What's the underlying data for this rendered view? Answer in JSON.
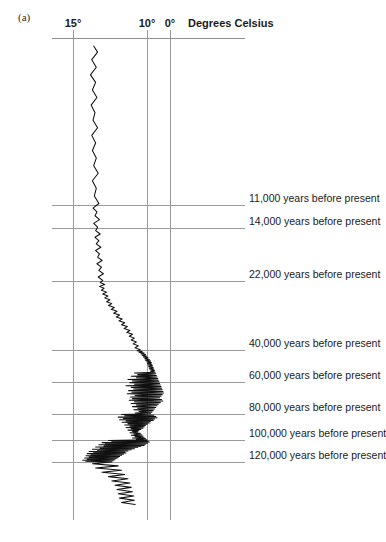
{
  "panel": {
    "label": "(a)"
  },
  "axis": {
    "title": "Degrees Celsius",
    "ticks": [
      {
        "label": "15°",
        "value": 15,
        "x": 73
      },
      {
        "label": "10°",
        "value": 10,
        "x": 147
      },
      {
        "label": "0°",
        "value": 0,
        "x": 170
      }
    ]
  },
  "timeline": [
    {
      "label": "11,000 years before present",
      "years": 11000,
      "y": 205
    },
    {
      "label": "14,000 years before present",
      "years": 14000,
      "y": 228
    },
    {
      "label": "22,000 years before present",
      "years": 22000,
      "y": 281
    },
    {
      "label": "40,000 years before present",
      "years": 40000,
      "y": 350
    },
    {
      "label": "60,000 years before present",
      "years": 60000,
      "y": 382
    },
    {
      "label": "80,000 years before present",
      "years": 80000,
      "y": 414
    },
    {
      "label": "100,000 years before present",
      "years": 100000,
      "y": 440
    },
    {
      "label": "120,000 years before present",
      "years": 120000,
      "y": 462
    }
  ],
  "chart_data": {
    "type": "line",
    "title": "Degrees Celsius",
    "xlabel": "Degrees Celsius",
    "ylabel": "years before present",
    "orientation": "vertical-time-axis",
    "grid": true,
    "legend": "none",
    "xlim": [
      0,
      15
    ],
    "ylim": [
      0,
      130000
    ],
    "x_tick_values": [
      15,
      10,
      0
    ],
    "x_tick_labels": [
      "15°",
      "10°",
      "0°"
    ],
    "y_tick_values": [
      11000,
      14000,
      22000,
      40000,
      60000,
      80000,
      100000,
      120000
    ],
    "y_tick_labels": [
      "11,000 years before present",
      "14,000 years before present",
      "22,000 years before present",
      "40,000 years before present",
      "60,000 years before present",
      "80,000 years before present",
      "100,000 years before present",
      "120,000 years before present"
    ],
    "series": [
      {
        "name": "Reconstructed temperature",
        "color": "#111111",
        "points": [
          [
            11.8,
            500
          ],
          [
            11.2,
            900
          ],
          [
            12.1,
            1400
          ],
          [
            11.4,
            1900
          ],
          [
            12.3,
            2400
          ],
          [
            11.5,
            2900
          ],
          [
            12.0,
            3400
          ],
          [
            11.3,
            3900
          ],
          [
            12.2,
            4400
          ],
          [
            11.6,
            4900
          ],
          [
            11.9,
            5400
          ],
          [
            11.2,
            5900
          ],
          [
            12.1,
            6400
          ],
          [
            11.5,
            6900
          ],
          [
            12.0,
            7400
          ],
          [
            11.4,
            7900
          ],
          [
            11.8,
            8400
          ],
          [
            11.1,
            8900
          ],
          [
            12.0,
            9400
          ],
          [
            11.4,
            9900
          ],
          [
            11.7,
            10400
          ],
          [
            11.0,
            10900
          ],
          [
            11.9,
            11400
          ],
          [
            11.3,
            11900
          ],
          [
            11.6,
            12400
          ],
          [
            10.9,
            12900
          ],
          [
            11.8,
            13400
          ],
          [
            11.2,
            13900
          ],
          [
            11.5,
            14400
          ],
          [
            10.8,
            14900
          ],
          [
            11.6,
            15400
          ],
          [
            11.0,
            15900
          ],
          [
            11.4,
            16400
          ],
          [
            10.7,
            16900
          ],
          [
            11.5,
            17400
          ],
          [
            10.9,
            17900
          ],
          [
            11.2,
            18400
          ],
          [
            10.5,
            18900
          ],
          [
            11.3,
            19400
          ],
          [
            10.6,
            19900
          ],
          [
            11.0,
            20400
          ],
          [
            10.3,
            20900
          ],
          [
            11.1,
            21400
          ],
          [
            10.4,
            21900
          ],
          [
            10.8,
            22400
          ],
          [
            10.1,
            22900
          ],
          [
            10.9,
            23400
          ],
          [
            10.2,
            23900
          ],
          [
            10.6,
            24400
          ],
          [
            9.8,
            24900
          ],
          [
            10.4,
            25400
          ],
          [
            9.6,
            25900
          ],
          [
            10.1,
            26400
          ],
          [
            9.3,
            26900
          ],
          [
            9.8,
            27400
          ],
          [
            9.0,
            27900
          ],
          [
            9.5,
            28400
          ],
          [
            8.6,
            28900
          ],
          [
            9.1,
            29400
          ],
          [
            8.2,
            29900
          ],
          [
            8.7,
            30400
          ],
          [
            7.8,
            30900
          ],
          [
            8.3,
            31400
          ],
          [
            7.4,
            31900
          ],
          [
            7.9,
            32400
          ],
          [
            7.0,
            32900
          ],
          [
            7.5,
            33400
          ],
          [
            6.6,
            33900
          ],
          [
            7.1,
            34400
          ],
          [
            6.2,
            34900
          ],
          [
            6.7,
            35400
          ],
          [
            5.8,
            35900
          ],
          [
            6.3,
            36400
          ],
          [
            5.5,
            36900
          ],
          [
            6.0,
            37400
          ],
          [
            5.2,
            37900
          ],
          [
            5.7,
            38400
          ],
          [
            4.9,
            38900
          ],
          [
            5.4,
            39400
          ],
          [
            4.6,
            39900
          ],
          [
            5.1,
            40400
          ],
          [
            4.3,
            40900
          ],
          [
            4.8,
            41400
          ],
          [
            4.0,
            41900
          ],
          [
            4.5,
            42400
          ],
          [
            3.8,
            42900
          ],
          [
            4.3,
            43400
          ],
          [
            3.6,
            43900
          ],
          [
            4.1,
            44400
          ],
          [
            3.4,
            44900
          ],
          [
            3.9,
            45400
          ],
          [
            3.2,
            45900
          ],
          [
            3.8,
            46400
          ],
          [
            3.0,
            46900
          ],
          [
            3.6,
            47400
          ],
          [
            2.9,
            47900
          ],
          [
            3.5,
            48400
          ],
          [
            2.8,
            48900
          ],
          [
            3.4,
            49400
          ],
          [
            2.7,
            49900
          ],
          [
            3.3,
            50400
          ],
          [
            2.6,
            50900
          ],
          [
            3.2,
            51400
          ],
          [
            2.5,
            51900
          ],
          [
            3.1,
            52400
          ],
          [
            2.4,
            52900
          ],
          [
            3.0,
            53400
          ],
          [
            2.3,
            53900
          ],
          [
            5.5,
            54400
          ],
          [
            2.2,
            54900
          ],
          [
            5.0,
            55400
          ],
          [
            2.1,
            55900
          ],
          [
            6.0,
            56400
          ],
          [
            2.0,
            56900
          ],
          [
            5.2,
            57400
          ],
          [
            1.9,
            57900
          ],
          [
            6.5,
            58400
          ],
          [
            1.8,
            58900
          ],
          [
            5.8,
            59400
          ],
          [
            1.7,
            59900
          ],
          [
            6.2,
            60400
          ],
          [
            1.6,
            60900
          ],
          [
            5.5,
            61400
          ],
          [
            1.5,
            61900
          ],
          [
            6.8,
            62400
          ],
          [
            1.4,
            62900
          ],
          [
            6.0,
            63400
          ],
          [
            1.3,
            63900
          ],
          [
            5.6,
            64400
          ],
          [
            1.2,
            64900
          ],
          [
            6.4,
            65400
          ],
          [
            1.1,
            65900
          ],
          [
            5.9,
            66400
          ],
          [
            1.0,
            66900
          ],
          [
            6.6,
            67400
          ],
          [
            1.2,
            67900
          ],
          [
            5.4,
            68400
          ],
          [
            1.4,
            68900
          ],
          [
            6.1,
            69400
          ],
          [
            1.6,
            69900
          ],
          [
            5.8,
            70400
          ],
          [
            1.3,
            70900
          ],
          [
            6.3,
            71400
          ],
          [
            1.1,
            71900
          ],
          [
            5.5,
            72400
          ],
          [
            1.5,
            72900
          ],
          [
            6.0,
            73400
          ],
          [
            1.8,
            73900
          ],
          [
            5.2,
            74400
          ],
          [
            2.0,
            74900
          ],
          [
            5.8,
            75400
          ],
          [
            2.2,
            75900
          ],
          [
            5.0,
            76400
          ],
          [
            2.4,
            76900
          ],
          [
            5.6,
            77400
          ],
          [
            2.6,
            77900
          ],
          [
            4.8,
            78400
          ],
          [
            2.8,
            78900
          ],
          [
            5.4,
            79400
          ],
          [
            3.0,
            79900
          ],
          [
            7.5,
            80400
          ],
          [
            2.5,
            80900
          ],
          [
            7.0,
            81400
          ],
          [
            2.2,
            81900
          ],
          [
            8.0,
            82400
          ],
          [
            2.0,
            82900
          ],
          [
            7.2,
            83400
          ],
          [
            2.4,
            83900
          ],
          [
            7.8,
            84400
          ],
          [
            2.6,
            84900
          ],
          [
            6.8,
            85400
          ],
          [
            3.0,
            85900
          ],
          [
            7.4,
            86400
          ],
          [
            3.2,
            86900
          ],
          [
            6.5,
            87400
          ],
          [
            3.5,
            87900
          ],
          [
            7.0,
            88400
          ],
          [
            3.8,
            88900
          ],
          [
            6.2,
            89400
          ],
          [
            4.0,
            89900
          ],
          [
            6.8,
            90400
          ],
          [
            4.2,
            90900
          ],
          [
            6.0,
            91400
          ],
          [
            4.5,
            91900
          ],
          [
            6.5,
            92400
          ],
          [
            4.8,
            92900
          ],
          [
            5.8,
            93400
          ],
          [
            5.0,
            93900
          ],
          [
            6.2,
            94400
          ],
          [
            4.6,
            94900
          ],
          [
            5.6,
            95400
          ],
          [
            4.4,
            95900
          ],
          [
            6.0,
            96400
          ],
          [
            4.2,
            96900
          ],
          [
            5.4,
            97400
          ],
          [
            4.0,
            97900
          ],
          [
            5.8,
            98400
          ],
          [
            3.8,
            98900
          ],
          [
            5.2,
            99400
          ],
          [
            3.6,
            99900
          ],
          [
            9.5,
            100400
          ],
          [
            3.4,
            100900
          ],
          [
            9.0,
            101400
          ],
          [
            3.2,
            101900
          ],
          [
            10.5,
            102400
          ],
          [
            3.5,
            102900
          ],
          [
            10.0,
            103400
          ],
          [
            3.8,
            103900
          ],
          [
            11.0,
            104400
          ],
          [
            4.0,
            104900
          ],
          [
            10.2,
            105400
          ],
          [
            4.5,
            105900
          ],
          [
            11.5,
            106400
          ],
          [
            5.0,
            106900
          ],
          [
            10.8,
            107400
          ],
          [
            5.5,
            107900
          ],
          [
            12.0,
            108400
          ],
          [
            6.0,
            108900
          ],
          [
            11.2,
            109400
          ],
          [
            6.5,
            109900
          ],
          [
            12.5,
            110400
          ],
          [
            7.0,
            110900
          ],
          [
            11.8,
            111400
          ],
          [
            6.8,
            111900
          ],
          [
            12.8,
            112400
          ],
          [
            7.2,
            112900
          ],
          [
            12.2,
            113400
          ],
          [
            7.5,
            113900
          ],
          [
            13.0,
            114400
          ],
          [
            7.8,
            114900
          ],
          [
            12.5,
            115400
          ],
          [
            8.0,
            115900
          ],
          [
            13.2,
            116400
          ],
          [
            8.2,
            116900
          ],
          [
            12.8,
            117400
          ],
          [
            8.5,
            117900
          ],
          [
            13.5,
            118400
          ],
          [
            8.8,
            118900
          ],
          [
            13.0,
            119400
          ],
          [
            9.0,
            119900
          ],
          [
            12.0,
            120400
          ],
          [
            8.0,
            120900
          ],
          [
            11.5,
            121400
          ],
          [
            7.5,
            121900
          ],
          [
            10.5,
            122400
          ],
          [
            7.0,
            122900
          ],
          [
            9.5,
            123400
          ],
          [
            6.5,
            123900
          ],
          [
            9.0,
            124400
          ],
          [
            6.2,
            124900
          ],
          [
            8.5,
            125400
          ],
          [
            6.0,
            125900
          ],
          [
            8.2,
            126400
          ],
          [
            5.8,
            126900
          ],
          [
            8.0,
            127400
          ],
          [
            5.6,
            127900
          ],
          [
            7.8,
            128400
          ],
          [
            5.5,
            128900
          ],
          [
            7.5,
            129400
          ],
          [
            5.4,
            129900
          ]
        ]
      }
    ]
  }
}
